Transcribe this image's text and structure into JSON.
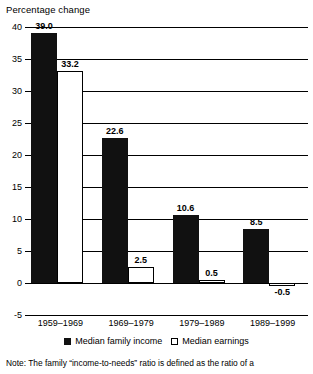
{
  "chart_data": {
    "type": "bar",
    "title": "Percentage change",
    "xlabel": "",
    "ylabel": "Percentage change",
    "ylim": [
      -5,
      40
    ],
    "yticks": [
      40,
      35,
      30,
      25,
      20,
      15,
      10,
      5,
      0,
      -5
    ],
    "grid": true,
    "legend_position": "bottom-center",
    "categories": [
      "1959–1969",
      "1969–1979",
      "1979–1989",
      "1989–1999"
    ],
    "series": [
      {
        "name": "Median family income",
        "color": "#111111",
        "values": [
          39.0,
          22.6,
          10.6,
          8.5
        ],
        "labels": [
          "39.0",
          "22.6",
          "10.6",
          "8.5"
        ]
      },
      {
        "name": "Median earnings",
        "color": "#ffffff",
        "values": [
          33.2,
          2.5,
          0.5,
          -0.5
        ],
        "labels": [
          "33.2",
          "2.5",
          "0.5",
          "-0.5"
        ]
      }
    ],
    "note": "Note: The family “income-to-needs” ratio is defined as the ratio of a"
  },
  "axis": {
    "title": "Percentage change",
    "tick_labels": [
      "40",
      "35",
      "30",
      "25",
      "20",
      "15",
      "10",
      "5",
      "0",
      "-5"
    ]
  },
  "legend": {
    "items": [
      {
        "label": "Median family income",
        "swatch": "filled-square-icon"
      },
      {
        "label": "Median earnings",
        "swatch": "outlined-square-icon"
      }
    ]
  },
  "footer": {
    "note": "Note: The family “income-to-needs” ratio is defined as the ratio of a"
  }
}
